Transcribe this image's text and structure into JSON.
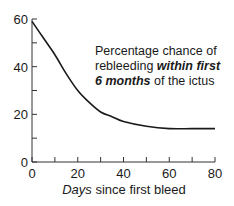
{
  "chart_data": {
    "type": "line",
    "title": "",
    "xlabel": "Days since first bleed",
    "xlabel_italic_part": "Days",
    "xlabel_rest": " since first bleed",
    "ylabel": "",
    "xlim": [
      0,
      80
    ],
    "ylim": [
      0,
      60
    ],
    "x_ticks": [
      0,
      20,
      40,
      60,
      80
    ],
    "x_minor_ticks": [
      10,
      30,
      50,
      70
    ],
    "y_ticks": [
      0,
      20,
      40,
      60
    ],
    "y_minor_ticks": [
      10,
      30,
      50
    ],
    "grid": false,
    "legend": null,
    "annotation": {
      "line1": "Percentage chance of",
      "line2_plain": "rebleeding ",
      "line2_bold": "within first",
      "line3_bold": "6 months",
      "line3_plain": " of the ictus"
    },
    "series": [
      {
        "name": "Percentage chance of rebleeding within first 6 months",
        "x": [
          0,
          5,
          10,
          15,
          20,
          25,
          30,
          35,
          40,
          50,
          60,
          70,
          80
        ],
        "values": [
          59,
          52,
          45,
          37,
          30,
          25,
          21,
          19,
          17,
          15,
          14,
          14,
          14
        ]
      }
    ]
  }
}
